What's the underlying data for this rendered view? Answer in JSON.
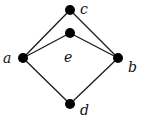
{
  "diagram": {
    "type": "hasse-diagram",
    "nodes": [
      {
        "id": "c",
        "label": "c",
        "x": 70,
        "y": 10,
        "lx": 80,
        "ly": 14
      },
      {
        "id": "e",
        "label": "e",
        "x": 70,
        "y": 33,
        "lx": 64,
        "ly": 62
      },
      {
        "id": "a",
        "label": "a",
        "x": 23,
        "y": 58,
        "lx": 3,
        "ly": 63
      },
      {
        "id": "b",
        "label": "b",
        "x": 118,
        "y": 58,
        "lx": 128,
        "ly": 72
      },
      {
        "id": "d",
        "label": "d",
        "x": 70,
        "y": 104,
        "lx": 80,
        "ly": 115
      }
    ],
    "edges": [
      {
        "from": "a",
        "to": "c"
      },
      {
        "from": "a",
        "to": "e"
      },
      {
        "from": "c",
        "to": "b"
      },
      {
        "from": "e",
        "to": "b"
      },
      {
        "from": "a",
        "to": "d"
      },
      {
        "from": "d",
        "to": "b"
      }
    ],
    "colors": {
      "node": "#000000",
      "edge": "#1a1a1a",
      "background": "#ffffff"
    }
  }
}
